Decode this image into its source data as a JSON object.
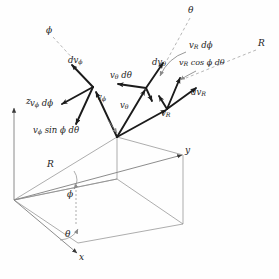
{
  "figure": {
    "type": "vector-diagram",
    "title_visible": false,
    "background_color": "#fefefe",
    "ink_color": "#1b1b1b",
    "thin_line_color": "#6e6e6e",
    "dashed_line_color": "#9a9a9a"
  },
  "axes": [
    {
      "name": "z-axis",
      "label": "z",
      "x": 28,
      "y": 103
    },
    {
      "name": "y-axis",
      "label": "y",
      "x": 186,
      "y": 152
    },
    {
      "name": "x-axis",
      "label": "x",
      "x": 80,
      "y": 259
    }
  ],
  "angles": [
    {
      "name": "angle-R",
      "label": "R",
      "x": 48,
      "y": 166
    },
    {
      "name": "angle-phi",
      "label": "ϕ",
      "x": 68,
      "y": 196
    },
    {
      "name": "angle-theta",
      "label": "θ",
      "x": 66,
      "y": 236
    }
  ],
  "guides": [
    {
      "name": "guide-phi",
      "label": "ϕ",
      "x": 47,
      "y": 30
    },
    {
      "name": "guide-theta",
      "label": "θ",
      "x": 189,
      "y": 10
    },
    {
      "name": "guide-R",
      "label": "R",
      "x": 259,
      "y": 43
    }
  ],
  "vectors": [
    {
      "name": "vector-dv-phi",
      "base": "dv",
      "sub": "ϕ",
      "suffix": "",
      "x": 69,
      "y": 62
    },
    {
      "name": "vector-v-phi-dphi",
      "base": "v",
      "sub": "ϕ",
      "suffix": " dϕ",
      "x": 31,
      "y": 105
    },
    {
      "name": "vector-v-phi-sin-phi-dtheta",
      "base": "v",
      "sub": "ϕ",
      "suffix": " sin ϕ dθ",
      "x": 34,
      "y": 132
    },
    {
      "name": "vector-v-phi",
      "base": "v",
      "sub": "ϕ",
      "suffix": "",
      "x": 98,
      "y": 99
    },
    {
      "name": "vector-v-theta-dtheta",
      "base": "v",
      "sub": "θ",
      "suffix": " dθ",
      "x": 111,
      "y": 77
    },
    {
      "name": "vector-v-theta",
      "base": "v",
      "sub": "θ",
      "suffix": "",
      "x": 121,
      "y": 107
    },
    {
      "name": "vector-dv-theta",
      "base": "dv",
      "sub": "θ",
      "suffix": "",
      "x": 153,
      "y": 64
    },
    {
      "name": "vector-vR-dphi",
      "base": "v",
      "sub": "R",
      "suffix": " dϕ",
      "x": 190,
      "y": 47
    },
    {
      "name": "vector-vR-cos-phi-dtheta",
      "base": "v",
      "sub": "R",
      "suffix": " cos ϕ dθ",
      "x": 180,
      "y": 65
    },
    {
      "name": "vector-dv-R",
      "base": "dv",
      "sub": "R",
      "suffix": "",
      "x": 192,
      "y": 94
    },
    {
      "name": "vector-v-R",
      "base": "v",
      "sub": "R",
      "suffix": "",
      "x": 162,
      "y": 115
    }
  ]
}
